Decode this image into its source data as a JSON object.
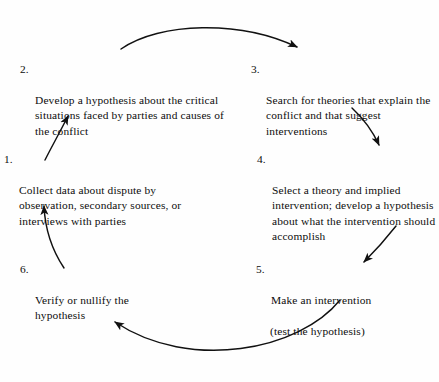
{
  "figure": {
    "title": "Action research cycle diagram",
    "type": "cyclic-process",
    "background_color": "#fefefe",
    "stroke_color": "#111111",
    "step_count": 6
  },
  "steps": [
    {
      "id": "step-1",
      "number": "1.",
      "text": "Collect data about dispute by observation, secondary sources, or interviews with parties",
      "lines": [
        "Collect data about dispute by",
        "observation, secondary sources,",
        "or interviews with parties"
      ]
    },
    {
      "id": "step-2",
      "number": "2.",
      "text": "Develop a hypothesis about the critical situations faced by parties and causes of the conflict",
      "lines": [
        "Develop a hypothesis about",
        "the critical situations faced by",
        "parties and causes of the conflict"
      ]
    },
    {
      "id": "step-3",
      "number": "3.",
      "text": "Search for theories that explain the conflict and that suggest interventions",
      "lines": [
        "Search for theories that",
        "explain the conflict and",
        "that suggest interventions"
      ]
    },
    {
      "id": "step-4",
      "number": "4.",
      "text": "Select a theory and implied intervention; develop a hypothesis about what the intervention should accomplish",
      "lines": [
        "Select a theory and implied",
        "intervention; develop a",
        "hypothesis about what the",
        "intervention should",
        "accomplish"
      ]
    },
    {
      "id": "step-5",
      "number": "5.",
      "text": "Make an intervention (test the hypothesis)",
      "lines": [
        "Make an intervention",
        "(test the hypothesis)"
      ]
    },
    {
      "id": "step-6",
      "number": "6.",
      "text": "Verify or nullify the hypothesis",
      "lines": [
        "Verify or nullify the",
        "hypothesis"
      ]
    }
  ],
  "arrows": [
    {
      "name": "arrow-2-to-3",
      "from": "step-2",
      "to": "step-3",
      "style": "curved-arc",
      "direction": "clockwise-top"
    },
    {
      "name": "arrow-3-to-4",
      "from": "step-3",
      "to": "step-4",
      "style": "curved-arc",
      "direction": "down-right"
    },
    {
      "name": "arrow-4-to-5",
      "from": "step-4",
      "to": "step-5",
      "style": "curved-arc",
      "direction": "down-left"
    },
    {
      "name": "arrow-5-to-6",
      "from": "step-5",
      "to": "step-6",
      "style": "curved-arc",
      "direction": "clockwise-bottom"
    },
    {
      "name": "arrow-6-to-1",
      "from": "step-6",
      "to": "step-1",
      "style": "curved-arc",
      "direction": "up-left"
    },
    {
      "name": "arrow-1-to-2",
      "from": "step-1",
      "to": "step-2",
      "style": "curved-arc",
      "direction": "up-right"
    }
  ]
}
